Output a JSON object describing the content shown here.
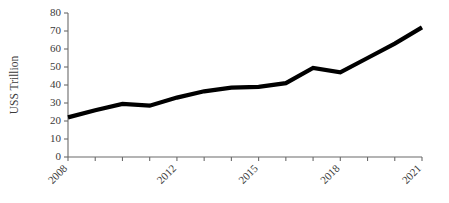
{
  "chart_data": {
    "type": "line",
    "title": "",
    "subtitle": "",
    "xlabel": "",
    "ylabel": "US$ Trillion",
    "ylabel_rendered": "USS Trillion",
    "x": [
      2008,
      2009,
      2010,
      2011,
      2012,
      2013,
      2014,
      2015,
      2016,
      2017,
      2018,
      2019,
      2020,
      2021
    ],
    "categories": [
      "2008",
      "2009",
      "2010",
      "2011",
      "2012",
      "2013",
      "2014",
      "2015",
      "2016",
      "2017",
      "2018",
      "2019",
      "2020",
      "2021"
    ],
    "values": [
      22,
      26,
      29.5,
      28.5,
      33,
      36.5,
      38.5,
      39,
      41,
      49.5,
      47,
      55,
      63,
      72
    ],
    "series": [
      {
        "name": "US$ Trillion",
        "color": "#000000",
        "values": [
          22,
          26,
          29.5,
          28.5,
          33,
          36.5,
          38.5,
          39,
          41,
          49.5,
          47,
          55,
          63,
          72
        ]
      }
    ],
    "ylim": [
      0,
      80
    ],
    "ytick_values": [
      0,
      10,
      20,
      30,
      40,
      50,
      60,
      70,
      80
    ],
    "ytick_labels": [
      "0",
      "10",
      "20",
      "30",
      "40",
      "50",
      "60",
      "70",
      "80"
    ],
    "xtick_values": [
      2008,
      2009,
      2010,
      2011,
      2012,
      2013,
      2014,
      2015,
      2016,
      2017,
      2018,
      2019,
      2020,
      2021
    ],
    "xtick_labels_visible": [
      "2008",
      "2012",
      "2015",
      "2018",
      "2021"
    ],
    "xtick_label_rotation": -45,
    "xlim": [
      2008,
      2021
    ],
    "grid": false,
    "legend": false,
    "legend_position": "none",
    "annotations": [],
    "line_color": "#000000",
    "line_width": 4.2,
    "axis_color": "#6b6b6b",
    "background_color": "#ffffff",
    "markers": false
  },
  "layout": {
    "plot_left": 68,
    "plot_right": 422,
    "plot_top": 13,
    "plot_bottom": 157
  }
}
